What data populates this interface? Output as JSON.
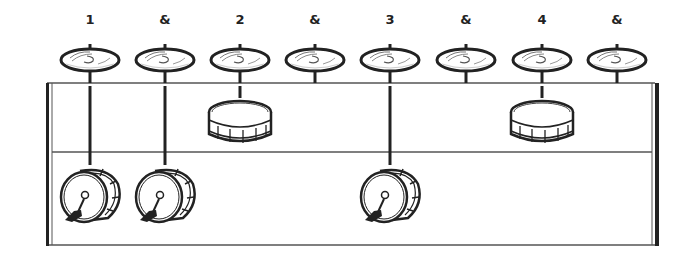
{
  "counts": [
    "1",
    "&",
    "2",
    "&",
    "3",
    "&",
    "4",
    "&"
  ],
  "beat_x": [
    90,
    165,
    240,
    315,
    390,
    466,
    542,
    617
  ],
  "rows": {
    "hihat": {
      "name": "Hi-hat / cymbal",
      "hits": [
        1,
        1,
        1,
        1,
        1,
        1,
        1,
        1
      ]
    },
    "snare": {
      "name": "Snare drum",
      "hits": [
        0,
        0,
        1,
        0,
        0,
        0,
        1,
        0
      ]
    },
    "kick": {
      "name": "Bass drum (kick)",
      "hits": [
        1,
        1,
        0,
        0,
        1,
        0,
        0,
        0
      ]
    }
  },
  "colors": {
    "ink": "#222222",
    "background": "#ffffff",
    "line": "#555555"
  },
  "icons": {
    "hihat": "cymbal-icon",
    "snare": "snare-drum-icon",
    "kick": "kick-drum-icon"
  }
}
